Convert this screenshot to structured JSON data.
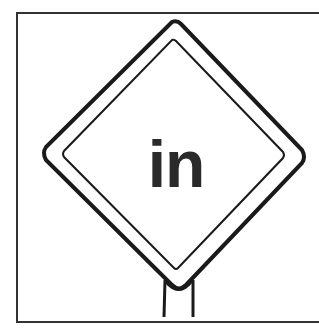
{
  "sign": {
    "text": "in",
    "shape": "diamond",
    "colors": {
      "stroke": "#1a1a1a",
      "background": "#ffffff",
      "text": "#2a2a2a"
    }
  }
}
